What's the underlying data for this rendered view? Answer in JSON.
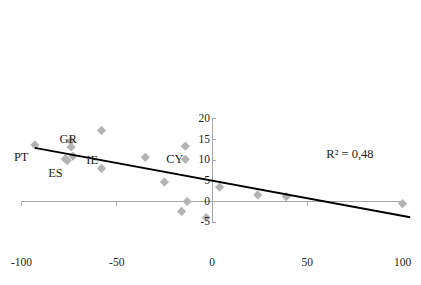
{
  "chart_data": {
    "type": "scatter",
    "title": "",
    "subtitle": "",
    "xlabel": "",
    "ylabel": "",
    "xlim": [
      -100,
      100
    ],
    "ylim": [
      -5,
      20
    ],
    "xticks": [
      -100,
      -50,
      0,
      50,
      100
    ],
    "xtick_labels": [
      "-100",
      "-50",
      "0",
      "50",
      "100"
    ],
    "yticks": [
      -5,
      0,
      5,
      10,
      15,
      20
    ],
    "ytick_labels": [
      "-5",
      "0",
      "5",
      "10",
      "15",
      "20"
    ],
    "grid": false,
    "legend": "none",
    "marker_color": "#b3b3b3",
    "axis_color": "#a6a6a6",
    "trendline_color": "#000000",
    "points": [
      {
        "x": -93,
        "y": 13.7,
        "label": "PT"
      },
      {
        "x": -74,
        "y": 14.6,
        "label": "GR"
      },
      {
        "x": -74,
        "y": 13.2,
        "label": ""
      },
      {
        "x": -73,
        "y": 11.0,
        "label": "IE"
      },
      {
        "x": -76,
        "y": 9.9,
        "label": "ES"
      },
      {
        "x": -77,
        "y": 10.3,
        "label": ""
      },
      {
        "x": -58,
        "y": 17.2,
        "label": ""
      },
      {
        "x": -58,
        "y": 8.0,
        "label": ""
      },
      {
        "x": -35,
        "y": 10.7,
        "label": ""
      },
      {
        "x": -14,
        "y": 13.4,
        "label": "CY"
      },
      {
        "x": -14,
        "y": 10.2,
        "label": ""
      },
      {
        "x": -25,
        "y": 4.7,
        "label": ""
      },
      {
        "x": 4,
        "y": 3.5,
        "label": ""
      },
      {
        "x": -13,
        "y": 0.0,
        "label": ""
      },
      {
        "x": -16,
        "y": -2.4,
        "label": ""
      },
      {
        "x": -3,
        "y": -3.9,
        "label": ""
      },
      {
        "x": 24,
        "y": 1.6,
        "label": ""
      },
      {
        "x": 39,
        "y": 1.2,
        "label": ""
      },
      {
        "x": 100,
        "y": -0.5,
        "label": ""
      }
    ],
    "trendline": {
      "x_start": -93,
      "y_start": 13.0,
      "x_end": 104,
      "y_end": -3.8
    },
    "annotations": [
      {
        "text": "R² = 0,48",
        "x": 60,
        "y": 13.0
      }
    ],
    "point_labels": [
      {
        "text": "GR",
        "x": -80,
        "y": 16.5
      },
      {
        "text": "PT",
        "x": -104,
        "y": 12.3
      },
      {
        "text": "IE",
        "x": -66,
        "y": 11.6
      },
      {
        "text": "ES",
        "x": -86,
        "y": 8.3
      },
      {
        "text": "CY",
        "x": -24,
        "y": 11.8
      }
    ]
  },
  "r_squared_text": "R² = 0,48"
}
